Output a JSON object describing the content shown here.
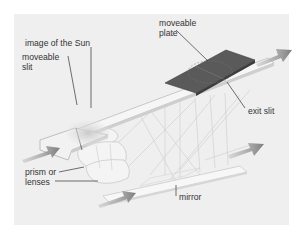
{
  "diagram": {
    "type": "labeled-illustration",
    "labels": {
      "image_of_sun": "image of the Sun",
      "moveable_slit_line1": "moveable",
      "moveable_slit_line2": "slit",
      "moveable_plate_line1": "moveable",
      "moveable_plate_line2": "plate",
      "exit_slit": "exit slit",
      "prism_line1": "prism or",
      "prism_line2": "lenses",
      "mirror": "mirror"
    },
    "components": [
      "moveable slit",
      "image of the Sun",
      "moveable plate",
      "exit slit",
      "prism or lenses",
      "mirror"
    ],
    "arrows": [
      {
        "name": "incoming-light-lower",
        "direction": "right-up"
      },
      {
        "name": "incoming-light-left",
        "direction": "right-up"
      },
      {
        "name": "outgoing-right-upper",
        "direction": "right-up"
      },
      {
        "name": "outgoing-right-lower",
        "direction": "right-up"
      }
    ],
    "colors": {
      "background": "#efefef",
      "frame": "#ffffff",
      "plate": "#5a5a5a",
      "arrow": "#8a8a8a",
      "strip": "#f6f6f6",
      "leader_line": "#333333"
    }
  }
}
